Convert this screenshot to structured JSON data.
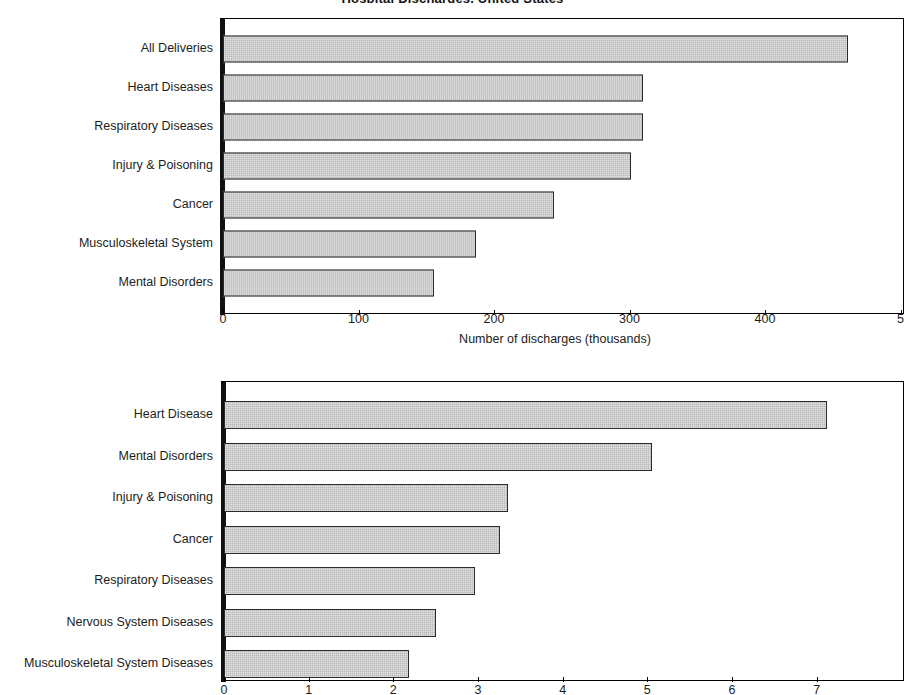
{
  "page": {
    "title_partial": "Hospital Discharges, United States"
  },
  "chart_data": [
    {
      "id": "discharges",
      "type": "bar",
      "orientation": "horizontal",
      "title": "",
      "xlabel": "Number of discharges (thousands)",
      "ylabel": "",
      "xlim": [
        0,
        500
      ],
      "xticks": [
        0,
        100,
        200,
        300,
        400,
        500
      ],
      "xtick_labels": [
        "0",
        "100",
        "200",
        "300",
        "400",
        "5"
      ],
      "grid": false,
      "legend": "none",
      "categories": [
        "All Deliveries",
        "Heart Diseases",
        "Respiratory Diseases",
        "Injury & Poisoning",
        "Cancer",
        "Musculoskeletal System",
        "Mental Disorders"
      ],
      "values": [
        461,
        310,
        310,
        301,
        244,
        187,
        156
      ]
    },
    {
      "id": "days-of-care",
      "type": "bar",
      "orientation": "horizontal",
      "title": "",
      "xlabel": "",
      "ylabel": "",
      "xlim": [
        0,
        7.8
      ],
      "xticks": [
        0,
        1,
        2,
        3,
        4,
        5,
        6,
        7
      ],
      "xtick_labels": [
        "0",
        "1",
        "2",
        "3",
        "4",
        "5",
        "6",
        "7"
      ],
      "grid": false,
      "legend": "none",
      "categories": [
        "Heart Disease",
        "Mental Disorders",
        "Injury & Poisoning",
        "Cancer",
        "Respiratory Diseases",
        "Nervous System Diseases",
        "Musculoskeletal System Diseases"
      ],
      "values": [
        7.12,
        5.05,
        3.35,
        3.26,
        2.97,
        2.5,
        2.18
      ]
    }
  ],
  "style": {
    "bar_fill": "#b9b9b9",
    "bar_border": "#2b2b2b",
    "axis_color": "#000000",
    "text_color": "#1c1c1c",
    "background": "#ffffff"
  }
}
